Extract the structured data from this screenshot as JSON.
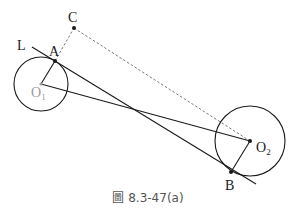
{
  "figure": {
    "caption": "圖 8.3-47(a)",
    "labels": {
      "C": "C",
      "L": "L",
      "A": "A",
      "O1": "O",
      "O1_sub": "1",
      "O2": "O",
      "O2_sub": "2",
      "B": "B"
    },
    "colors": {
      "line": "#1a1a1a",
      "dashed": "#777777",
      "o1_label": "#9a9a9a",
      "caption": "#555555"
    }
  }
}
